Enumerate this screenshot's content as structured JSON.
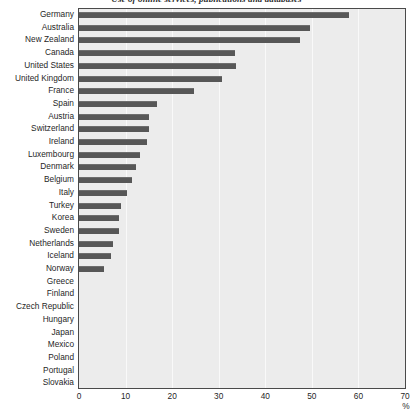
{
  "chart": {
    "title": "Use of online services, publications and databases",
    "x_unit": "%"
  },
  "chart_data": {
    "type": "bar",
    "orientation": "horizontal",
    "title": "Use of online services, publications and databases",
    "xlabel": "%",
    "ylabel": "",
    "xlim": [
      0,
      70
    ],
    "xticks": [
      0,
      10,
      20,
      30,
      40,
      50,
      60,
      70
    ],
    "grid": true,
    "legend": false,
    "bar_color": "#575757",
    "plot_background": "#ececec",
    "categories": [
      "Germany",
      "Australia",
      "New Zealand",
      "Canada",
      "United States",
      "United Kingdom",
      "France",
      "Spain",
      "Austria",
      "Switzerland",
      "Ireland",
      "Luxembourg",
      "Denmark",
      "Belgium",
      "Italy",
      "Turkey",
      "Korea",
      "Sweden",
      "Netherlands",
      "Iceland",
      "Norway",
      "Greece",
      "Finland",
      "Czech Republic",
      "Hungary",
      "Japan",
      "Mexico",
      "Poland",
      "Portugal",
      "Slovakia"
    ],
    "values": [
      58.0,
      49.5,
      47.5,
      33.5,
      33.7,
      30.7,
      24.7,
      16.8,
      15.0,
      15.0,
      14.5,
      13.0,
      12.2,
      11.3,
      10.2,
      9.0,
      8.5,
      8.5,
      7.2,
      6.8,
      5.3,
      0,
      0,
      0,
      0,
      0,
      0,
      0,
      0,
      0
    ]
  }
}
